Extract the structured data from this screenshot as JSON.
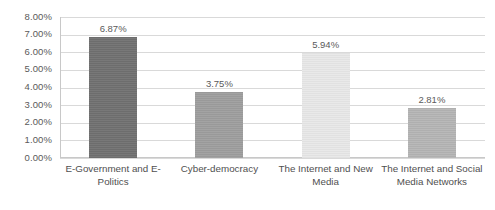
{
  "chart_data": {
    "type": "bar",
    "title": "",
    "xlabel": "",
    "ylabel": "",
    "categories": [
      "E-Government and E-Politics",
      "Cyber-democracy",
      "The Internet and New Media",
      "The Internet and Social Media Networks"
    ],
    "values": [
      6.87,
      3.75,
      5.94,
      2.81
    ],
    "value_labels": [
      "6.87%",
      "3.75%",
      "5.94%",
      "2.81%"
    ],
    "bar_colors": [
      "#717171",
      "#9e9e9e",
      "#e8e8e8",
      "#b5b5b5"
    ],
    "ylim": [
      0,
      8
    ],
    "ytick_labels": [
      "8.00%",
      "7.00%",
      "6.00%",
      "5.00%",
      "4.00%",
      "3.00%",
      "2.00%",
      "1.00%",
      "0.00%"
    ],
    "ytick_values": [
      8,
      7,
      6,
      5,
      4,
      3,
      2,
      1,
      0
    ],
    "grid": true,
    "grid_axis": "y",
    "legend": false,
    "legend_position": "none",
    "grid_color": "#d9d9d9",
    "axis_color": "#c8c8c8",
    "text_color": "#5a5a5a"
  }
}
